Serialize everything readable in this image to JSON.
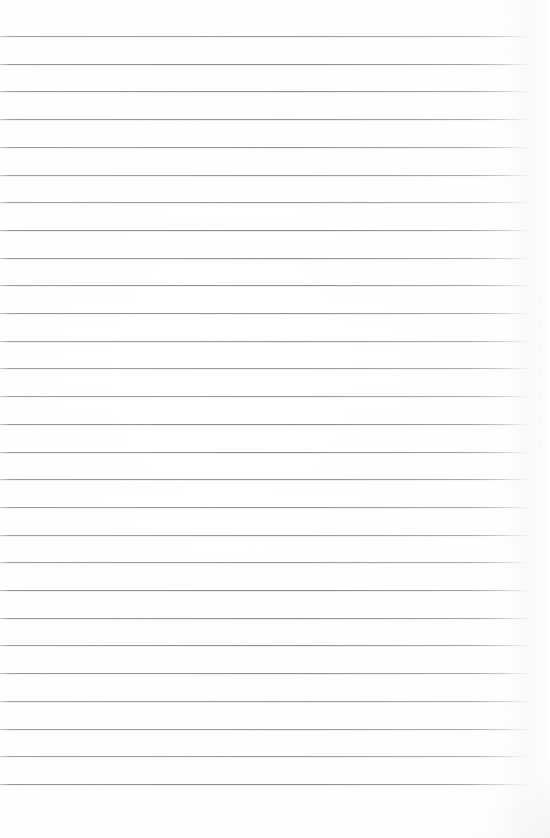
{
  "document": {
    "kind": "scanned-lined-notebook-page",
    "title": "Blank ruled notebook page",
    "body_text": "",
    "handwriting_present": "none",
    "page_width_px": 550,
    "page_height_px": 838
  },
  "paper": {
    "background_color": "#fefefe",
    "edge_shadow_color": "#f4f4f6",
    "texture": "faint horizontal scan banding"
  },
  "ruling": {
    "type": "horizontal-ruled",
    "line_color": "#848487",
    "line_thickness_px": 1,
    "line_count": 28,
    "first_line_y_px": 36,
    "line_spacing_px": 27.7,
    "line_start_x_px": 0,
    "line_end_x_px": 535,
    "right_fade": "lines fade toward the right margin",
    "top_margin_px": 36,
    "bottom_margin_px": 52,
    "line_y_positions": [
      36,
      63.7,
      91.4,
      119.1,
      146.8,
      174.5,
      202.2,
      229.9,
      257.6,
      285.3,
      313.0,
      340.7,
      368.4,
      396.1,
      423.8,
      451.5,
      479.2,
      506.9,
      534.6,
      562.3,
      590.0,
      617.7,
      645.4,
      673.1,
      700.8,
      728.5,
      756.2,
      783.9
    ],
    "line_end_x_positions": [
      534,
      536,
      535,
      534,
      533,
      535,
      534,
      536,
      533,
      535,
      534,
      533,
      536,
      534,
      535,
      533,
      534,
      536,
      535,
      533,
      534,
      535,
      533,
      536,
      534,
      535,
      533,
      534
    ]
  }
}
